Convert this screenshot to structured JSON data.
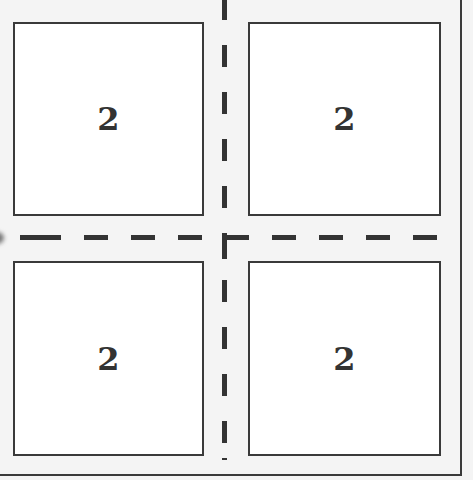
{
  "diagram": {
    "panels": [
      {
        "position": "top-left",
        "label": "2"
      },
      {
        "position": "top-right",
        "label": "2"
      },
      {
        "position": "bottom-left",
        "label": "2"
      },
      {
        "position": "bottom-right",
        "label": "2"
      }
    ],
    "dividers": {
      "vertical": "dashed",
      "horizontal": "dashed"
    },
    "colors": {
      "line": "#333333",
      "panel_fill": "#ffffff",
      "background": "#f4f4f4"
    }
  }
}
